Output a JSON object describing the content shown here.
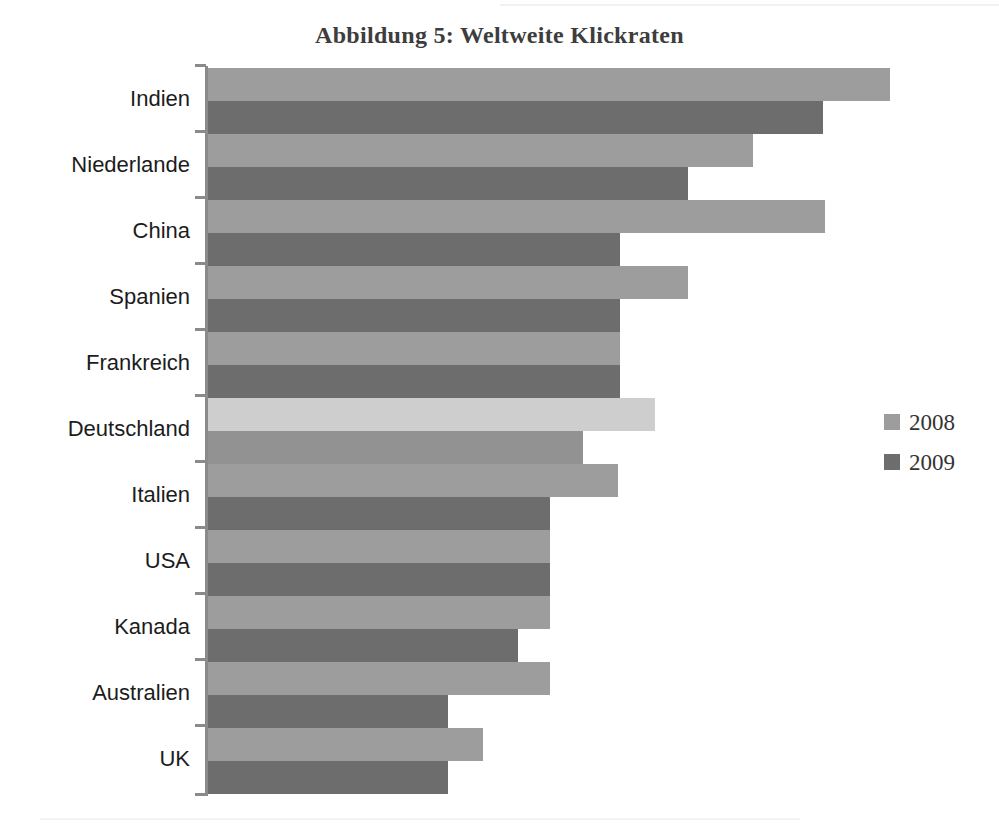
{
  "title": "Abbildung 5: Weltweite Klickraten",
  "legend": {
    "entries": [
      {
        "label": "2008",
        "color": "#9d9d9d"
      },
      {
        "label": "2009",
        "color": "#6d6d6d"
      }
    ]
  },
  "colors": {
    "series_2008": "#9d9d9d",
    "series_2009": "#6d6d6d",
    "series_2008_highlight": "#cecece",
    "series_2009_highlight": "#929292",
    "axis": "#8a8a8a",
    "title_text": "#3d3d3d",
    "label_text": "#1c1c1c",
    "background": "#ffffff"
  },
  "chart_data": {
    "type": "bar",
    "orientation": "horizontal",
    "title": "Abbildung 5: Weltweite Klickraten",
    "xlabel": "",
    "ylabel": "",
    "grid": false,
    "legend_position": "right",
    "axis_ticks_visible": true,
    "value_labels_visible": false,
    "xlim": [
      0,
      1.0
    ],
    "categories": [
      "Indien",
      "Niederlande",
      "China",
      "Spanien",
      "Frankreich",
      "Deutschland",
      "Italien",
      "USA",
      "Kanada",
      "Australien",
      "UK"
    ],
    "series": [
      {
        "name": "2008",
        "values": [
          1.0,
          0.8,
          0.91,
          0.71,
          0.61,
          0.65,
          0.61,
          0.51,
          0.51,
          0.51,
          0.41
        ]
      },
      {
        "name": "2009",
        "values": [
          0.91,
          0.71,
          0.61,
          0.61,
          0.61,
          0.55,
          0.51,
          0.51,
          0.46,
          0.36,
          0.36
        ]
      }
    ],
    "highlighted_category": "Deutschland"
  },
  "rows": [
    {
      "label": "Indien",
      "y": 68,
      "len2008": 682,
      "len2009": 615,
      "highlight": false
    },
    {
      "label": "Niederlande",
      "y": 134,
      "len2008": 545,
      "len2009": 480,
      "highlight": false
    },
    {
      "label": "China",
      "y": 200,
      "len2008": 617,
      "len2009": 412,
      "highlight": false
    },
    {
      "label": "Spanien",
      "y": 266,
      "len2008": 480,
      "len2009": 412,
      "highlight": false
    },
    {
      "label": "Frankreich",
      "y": 332,
      "len2008": 412,
      "len2009": 412,
      "highlight": false
    },
    {
      "label": "Deutschland",
      "y": 398,
      "len2008": 447,
      "len2009": 375,
      "highlight": true
    },
    {
      "label": "Italien",
      "y": 464,
      "len2008": 410,
      "len2009": 342,
      "highlight": false
    },
    {
      "label": "USA",
      "y": 530,
      "len2008": 342,
      "len2009": 342,
      "highlight": false
    },
    {
      "label": "Kanada",
      "y": 596,
      "len2008": 342,
      "len2009": 310,
      "highlight": false
    },
    {
      "label": "Australien",
      "y": 662,
      "len2008": 342,
      "len2009": 240,
      "highlight": false
    },
    {
      "label": "UK",
      "y": 728,
      "len2008": 275,
      "len2009": 240,
      "highlight": false
    }
  ]
}
